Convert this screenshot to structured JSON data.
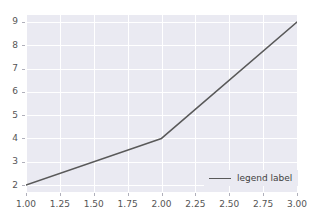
{
  "chart_data": {
    "type": "line",
    "title": "",
    "xlabel": "",
    "ylabel": "",
    "xlim": [
      1.0,
      3.0
    ],
    "ylim": [
      1.7,
      9.3
    ],
    "grid": true,
    "legend_position": "lower right",
    "x": [
      1,
      2,
      3
    ],
    "series": [
      {
        "name": "legend label",
        "values": [
          2,
          4,
          9
        ],
        "color": "#595959"
      }
    ],
    "xticks": [
      1.0,
      1.25,
      1.5,
      1.75,
      2.0,
      2.25,
      2.5,
      2.75,
      3.0
    ],
    "xtick_labels": [
      "1.00",
      "1.25",
      "1.50",
      "1.75",
      "2.00",
      "2.25",
      "2.50",
      "2.75",
      "3.00"
    ],
    "yticks": [
      2,
      3,
      4,
      5,
      6,
      7,
      8,
      9
    ],
    "ytick_labels": [
      "2",
      "3",
      "4",
      "5",
      "6",
      "7",
      "8",
      "9"
    ]
  },
  "legend": {
    "label": "legend label"
  },
  "style": {
    "plot_background": "#eaeaf2",
    "figure_background": "#ffffff",
    "gridline_color": "#ffffff",
    "line_color": "#595959",
    "tick_label_color": "#555555"
  }
}
